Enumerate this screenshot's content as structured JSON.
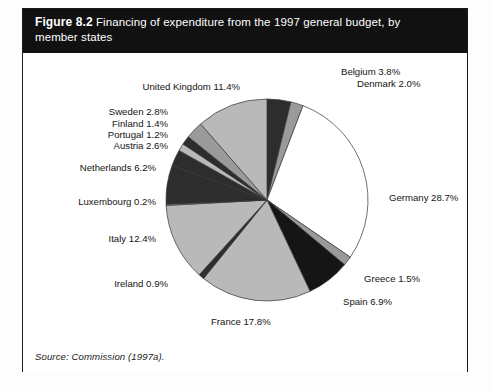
{
  "figure": {
    "number_label": "Figure 8.2",
    "title_line1": "Financing of expenditure from the 1997 general budget, by",
    "title_line2": "member states",
    "source": "Source: Commission (1997a)."
  },
  "colors": {
    "band_background": "#111111",
    "band_text": "#ffffff",
    "frame_border": "#1b1b1b",
    "page_background": "#ffffff",
    "slice_white": "#ffffff",
    "slice_light_gray": "#b9b9b9",
    "slice_mid_gray": "#9a9a9a",
    "slice_dark": "#2d2d2d",
    "slice_black": "#151515",
    "slice_outline": "#333333",
    "label_text": "#141414"
  },
  "chart_data": {
    "type": "pie",
    "title": "Financing of expenditure from the 1997 general budget, by member states",
    "unit": "%",
    "start_angle_deg": 0,
    "direction": "clockwise",
    "legend": "none",
    "labels_outside": true,
    "categories": [
      "Belgium",
      "Denmark",
      "Germany",
      "Greece",
      "Spain",
      "France",
      "Ireland",
      "Italy",
      "Luxembourg",
      "Netherlands",
      "Austria",
      "Portugal",
      "Finland",
      "Sweden",
      "United Kingdom"
    ],
    "values": [
      3.8,
      2.0,
      28.7,
      1.5,
      6.9,
      17.8,
      0.9,
      12.4,
      0.2,
      6.2,
      2.6,
      1.2,
      1.4,
      2.8,
      11.4
    ],
    "slices": [
      {
        "name": "Belgium",
        "value": 3.8,
        "label": "Belgium 3.8%",
        "fill": "#2d2d2d",
        "label_x": 318,
        "label_y": 22,
        "anchor": "start"
      },
      {
        "name": "Denmark",
        "value": 2.0,
        "label": "Denmark 2.0%",
        "fill": "#9a9a9a",
        "label_x": 334,
        "label_y": 34,
        "anchor": "start"
      },
      {
        "name": "Germany",
        "value": 28.7,
        "label": "Germany 28.7%",
        "fill": "#ffffff",
        "label_x": 366,
        "label_y": 148,
        "anchor": "start"
      },
      {
        "name": "Greece",
        "value": 1.5,
        "label": "Greece 1.5%",
        "fill": "#9a9a9a",
        "label_x": 341,
        "label_y": 229,
        "anchor": "start"
      },
      {
        "name": "Spain",
        "value": 6.9,
        "label": "Spain 6.9%",
        "fill": "#151515",
        "label_x": 320,
        "label_y": 252,
        "anchor": "start"
      },
      {
        "name": "France",
        "value": 17.8,
        "label": "France 17.8%",
        "fill": "#b9b9b9",
        "label_x": 188,
        "label_y": 272,
        "anchor": "start"
      },
      {
        "name": "Ireland",
        "value": 0.9,
        "label": "Ireland 0.9%",
        "fill": "#2d2d2d",
        "label_x": 145,
        "label_y": 234,
        "anchor": "end"
      },
      {
        "name": "Italy",
        "value": 12.4,
        "label": "Italy 12.4%",
        "fill": "#b9b9b9",
        "label_x": 133,
        "label_y": 189,
        "anchor": "end"
      },
      {
        "name": "Luxembourg",
        "value": 0.2,
        "label": "Luxembourg 0.2%",
        "fill": "#9a9a9a",
        "label_x": 133,
        "label_y": 152,
        "anchor": "end"
      },
      {
        "name": "Netherlands",
        "value": 6.2,
        "label": "Netherlands 6.2%",
        "fill": "#2d2d2d",
        "label_x": 133,
        "label_y": 118,
        "anchor": "end"
      },
      {
        "name": "Austria",
        "value": 2.6,
        "label": "Austria 2.6%",
        "fill": "#2d2d2d",
        "label_x": 145,
        "label_y": 96,
        "anchor": "end"
      },
      {
        "name": "Portugal",
        "value": 1.2,
        "label": "Portugal 1.2%",
        "fill": "#b9b9b9",
        "label_x": 145,
        "label_y": 85,
        "anchor": "end"
      },
      {
        "name": "Finland",
        "value": 1.4,
        "label": "Finland 1.4%",
        "fill": "#2d2d2d",
        "label_x": 145,
        "label_y": 74,
        "anchor": "end"
      },
      {
        "name": "Sweden",
        "value": 2.8,
        "label": "Sweden 2.8%",
        "fill": "#9a9a9a",
        "label_x": 145,
        "label_y": 62,
        "anchor": "end"
      },
      {
        "name": "United Kingdom",
        "value": 11.4,
        "label": "United Kingdom 11.4%",
        "fill": "#b9b9b9",
        "label_x": 217,
        "label_y": 37,
        "anchor": "end"
      }
    ],
    "geometry": {
      "cx": 244,
      "cy": 147,
      "r": 101
    }
  }
}
